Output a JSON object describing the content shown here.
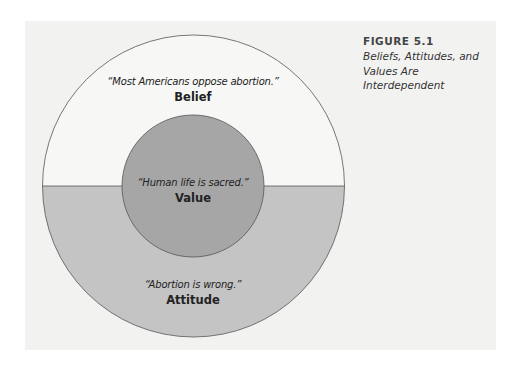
{
  "figure": {
    "number": "FIGURE 5.1",
    "title": "Beliefs, Attitudes, and Values Are Interdependent"
  },
  "diagram": {
    "belief": {
      "quote": "“Most Americans oppose abortion.”",
      "term": "Belief"
    },
    "value": {
      "quote": "“Human life is sacred.”",
      "term": "Value"
    },
    "attitude": {
      "quote": "“Abortion is wrong.”",
      "term": "Attitude"
    },
    "colors": {
      "background": "#f2f2f1",
      "belief_fill": "#f7f7f6",
      "attitude_fill": "#c4c4c4",
      "value_fill": "#a6a6a6",
      "stroke": "#555555"
    }
  }
}
